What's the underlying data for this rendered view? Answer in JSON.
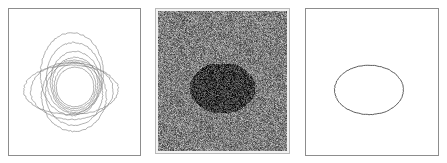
{
  "figure": {
    "panel_count": 3,
    "background_color": "#ffffff",
    "width": 447,
    "height": 163
  },
  "panels": [
    {
      "id": "contours-initial",
      "caption": "",
      "role": "initial and intermediate contours",
      "frame_color": "#8d8d8d",
      "contour_color": "#7a7a7a",
      "viewbox": [
        0,
        0,
        133,
        148
      ]
    },
    {
      "id": "noisy-image",
      "caption": "",
      "role": "noisy input image with dark elliptical object",
      "frame_color": "#b9b9b9",
      "background_gray": "#808080",
      "object_gray": "#3c3c3c",
      "noise_amplitude": 105,
      "viewbox": [
        0,
        0,
        133,
        144
      ]
    },
    {
      "id": "contour-final",
      "caption": "",
      "role": "converged segmentation contour",
      "frame_color": "#8d8d8d",
      "contour_color": "#4a4a4a",
      "viewbox": [
        0,
        0,
        134,
        148
      ]
    }
  ],
  "chart_data": {
    "type": "scatter",
    "subtitle": "",
    "xlabel": "",
    "ylabel": "",
    "grid": false,
    "legend_position": "none",
    "panels": [
      {
        "name": "initial contours",
        "type": "contour-set",
        "series": [
          {
            "name": "contour-1-tall-outer",
            "shape": "ellipse",
            "cx": 64,
            "cy": 66,
            "rx": 32,
            "ry": 42,
            "rotation": 0
          },
          {
            "name": "contour-2-tall",
            "shape": "ellipse",
            "cx": 66,
            "cy": 70,
            "rx": 28,
            "ry": 36,
            "rotation": 0
          },
          {
            "name": "contour-3-tall",
            "shape": "ellipse",
            "cx": 67,
            "cy": 74,
            "rx": 25,
            "ry": 31,
            "rotation": 0
          },
          {
            "name": "contour-4-mid",
            "shape": "ellipse",
            "cx": 67,
            "cy": 76,
            "rx": 23,
            "ry": 27,
            "rotation": 0
          },
          {
            "name": "contour-5-inner",
            "shape": "ellipse",
            "cx": 67,
            "cy": 78,
            "rx": 21,
            "ry": 23,
            "rotation": 0
          },
          {
            "name": "contour-6-circle",
            "shape": "ellipse",
            "cx": 67,
            "cy": 79,
            "rx": 19,
            "ry": 20,
            "rotation": 0
          },
          {
            "name": "contour-7-wide-outer",
            "shape": "ellipse",
            "cx": 63,
            "cy": 82,
            "rx": 48,
            "ry": 25,
            "rotation": 0
          },
          {
            "name": "contour-8-wide",
            "shape": "ellipse",
            "cx": 64,
            "cy": 83,
            "rx": 42,
            "ry": 29,
            "rotation": 0
          },
          {
            "name": "contour-9-lower-lobe",
            "shape": "ellipse",
            "cx": 66,
            "cy": 88,
            "rx": 33,
            "ry": 36,
            "rotation": 0
          },
          {
            "name": "contour-10-lower",
            "shape": "ellipse",
            "cx": 66,
            "cy": 86,
            "rx": 29,
            "ry": 32,
            "rotation": 0
          }
        ]
      },
      {
        "name": "noisy image",
        "type": "heatmap",
        "object": {
          "shape": "ellipse",
          "cx": 66,
          "cy": 79,
          "rx": 34,
          "ry": 26,
          "rotation": 0
        },
        "background_level": 128,
        "object_level": 60,
        "noise_sigma": 52
      },
      {
        "name": "final contour",
        "type": "contour-set",
        "series": [
          {
            "name": "final-contour",
            "shape": "ellipse",
            "cx": 64,
            "cy": 82,
            "rx": 35,
            "ry": 25,
            "rotation": 0
          }
        ]
      }
    ]
  }
}
